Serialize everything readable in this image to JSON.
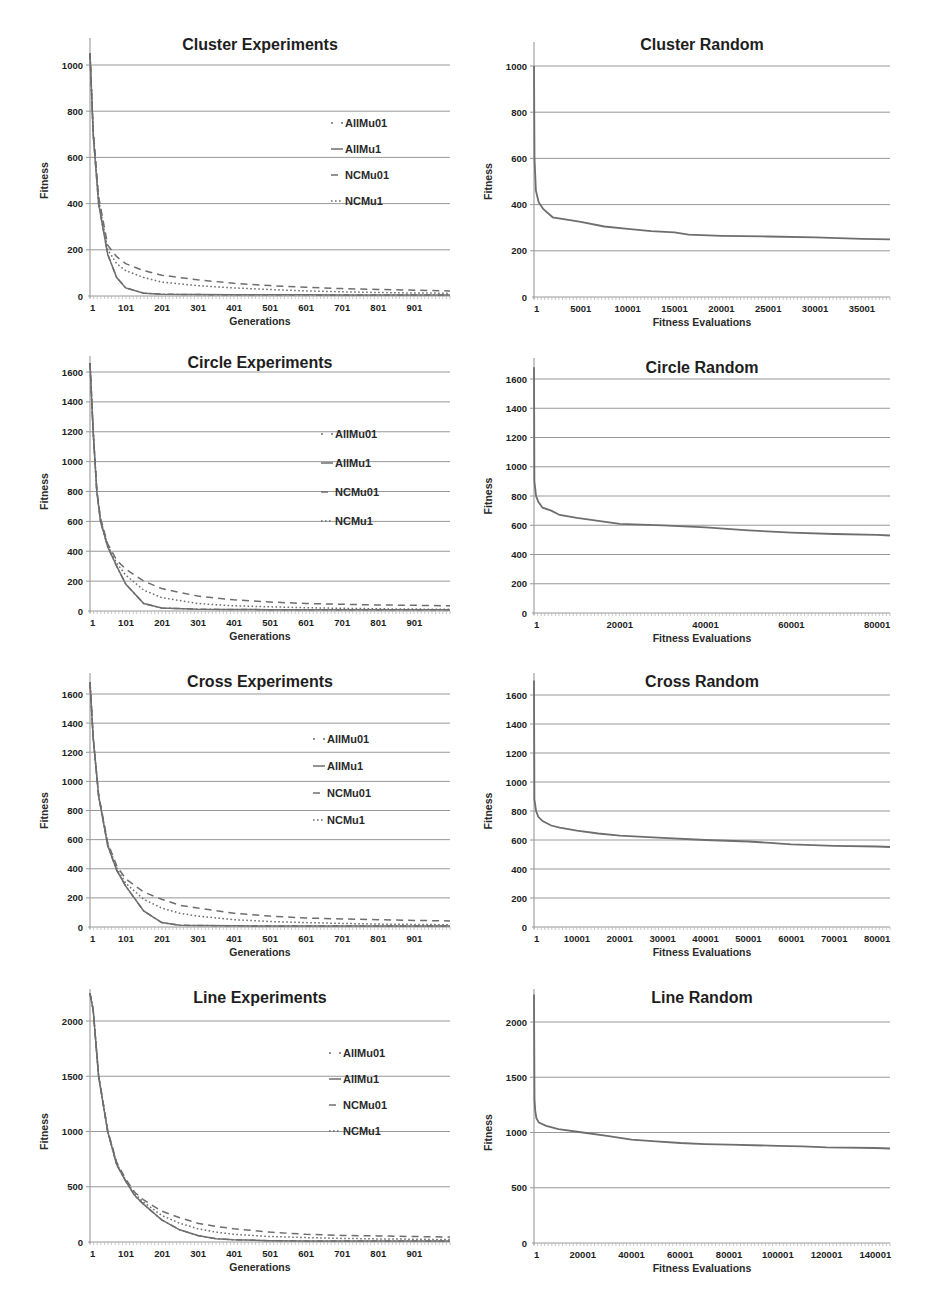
{
  "page": {
    "width": 931,
    "height": 1316
  },
  "colors": {
    "grid": "#8c8c8c",
    "axis": "#9a9a9a",
    "series": "#6e6e6e",
    "text": "#1e1e1e"
  },
  "chart_data": [
    {
      "id": "cluster-experiments",
      "type": "line",
      "title": "Cluster Experiments",
      "xlabel": "Generations",
      "ylabel": "Fitness",
      "xticks": [
        "1",
        "101",
        "201",
        "301",
        "401",
        "501",
        "601",
        "701",
        "801",
        "901"
      ],
      "yticks": [
        0,
        200,
        400,
        600,
        800,
        1000
      ],
      "ylim": [
        0,
        1060
      ],
      "xlim": [
        1,
        1000
      ],
      "grid": true,
      "legend_position": "right-inside",
      "x": [
        1,
        10,
        25,
        50,
        75,
        100,
        150,
        200,
        300,
        400,
        500,
        600,
        700,
        800,
        900,
        1000
      ],
      "series": [
        {
          "name": "AllMu01",
          "style": "dash-dot",
          "values": [
            1050,
            700,
            400,
            180,
            80,
            35,
            12,
            8,
            6,
            5,
            5,
            5,
            4,
            4,
            4,
            4
          ]
        },
        {
          "name": "AllMu1",
          "style": "solid",
          "values": [
            1050,
            700,
            400,
            180,
            80,
            35,
            12,
            8,
            6,
            5,
            5,
            5,
            4,
            4,
            4,
            4
          ]
        },
        {
          "name": "NCMu01",
          "style": "dashed",
          "values": [
            1050,
            720,
            430,
            220,
            170,
            140,
            110,
            90,
            70,
            55,
            45,
            38,
            32,
            28,
            25,
            22
          ]
        },
        {
          "name": "NCMu1",
          "style": "dotted",
          "values": [
            1050,
            710,
            420,
            200,
            140,
            110,
            80,
            60,
            45,
            35,
            28,
            22,
            18,
            15,
            13,
            12
          ]
        }
      ]
    },
    {
      "id": "cluster-random",
      "type": "line",
      "title": "Cluster Random",
      "xlabel": "Fitness Evaluations",
      "ylabel": "Fitness",
      "xticks": [
        "1",
        "5001",
        "10001",
        "15001",
        "20001",
        "25001",
        "30001",
        "35001"
      ],
      "yticks": [
        0,
        200,
        400,
        600,
        800,
        1000
      ],
      "ylim": [
        0,
        1000
      ],
      "xlim": [
        1,
        38000
      ],
      "grid": true,
      "x": [
        1,
        50,
        200,
        500,
        1000,
        2000,
        5000,
        7500,
        10000,
        12500,
        15000,
        16500,
        20000,
        25000,
        30000,
        35000,
        38000
      ],
      "series": [
        {
          "name": "Random",
          "style": "solid",
          "values": [
            1000,
            600,
            460,
            410,
            380,
            345,
            325,
            305,
            295,
            285,
            280,
            270,
            265,
            262,
            258,
            252,
            250
          ]
        }
      ]
    },
    {
      "id": "circle-experiments",
      "type": "line",
      "title": "Circle Experiments",
      "xlabel": "Generations",
      "ylabel": "Fitness",
      "xticks": [
        "1",
        "101",
        "201",
        "301",
        "401",
        "501",
        "601",
        "701",
        "801",
        "901"
      ],
      "yticks": [
        0,
        200,
        400,
        600,
        800,
        1000,
        1200,
        1400,
        1600
      ],
      "ylim": [
        0,
        1680
      ],
      "xlim": [
        1,
        1000
      ],
      "grid": true,
      "legend_position": "right-inside",
      "x": [
        1,
        10,
        20,
        30,
        50,
        75,
        100,
        150,
        200,
        300,
        400,
        500,
        600,
        700,
        800,
        900,
        1000
      ],
      "series": [
        {
          "name": "AllMu01",
          "style": "dash-dot",
          "values": [
            1660,
            1200,
            800,
            600,
            430,
            300,
            180,
            50,
            20,
            12,
            10,
            9,
            8,
            8,
            8,
            8,
            8
          ]
        },
        {
          "name": "AllMu1",
          "style": "solid",
          "values": [
            1660,
            1200,
            800,
            600,
            430,
            300,
            180,
            50,
            20,
            12,
            10,
            9,
            8,
            8,
            8,
            8,
            8
          ]
        },
        {
          "name": "NCMu01",
          "style": "dashed",
          "values": [
            1660,
            1200,
            810,
            620,
            450,
            340,
            280,
            200,
            150,
            100,
            75,
            60,
            50,
            45,
            40,
            38,
            35
          ]
        },
        {
          "name": "NCMu1",
          "style": "dotted",
          "values": [
            1660,
            1200,
            805,
            610,
            440,
            320,
            240,
            140,
            90,
            50,
            35,
            28,
            22,
            18,
            15,
            13,
            12
          ]
        }
      ]
    },
    {
      "id": "circle-random",
      "type": "line",
      "title": "Circle Random",
      "xlabel": "Fitness Evaluations",
      "ylabel": "Fitness",
      "xticks": [
        "1",
        "20001",
        "40001",
        "60001",
        "80001"
      ],
      "yticks": [
        0,
        200,
        400,
        600,
        800,
        1000,
        1200,
        1400,
        1600
      ],
      "ylim": [
        0,
        1680
      ],
      "xlim": [
        1,
        83000
      ],
      "grid": true,
      "x": [
        1,
        100,
        500,
        1000,
        2000,
        4000,
        6000,
        10000,
        15000,
        20000,
        30000,
        40000,
        50000,
        60000,
        70000,
        80000,
        83000
      ],
      "series": [
        {
          "name": "Random",
          "style": "solid",
          "values": [
            1680,
            900,
            800,
            760,
            720,
            700,
            670,
            650,
            630,
            610,
            600,
            585,
            565,
            550,
            540,
            535,
            530
          ]
        }
      ]
    },
    {
      "id": "cross-experiments",
      "type": "line",
      "title": "Cross Experiments",
      "xlabel": "Generations",
      "ylabel": "Fitness",
      "xticks": [
        "1",
        "101",
        "201",
        "301",
        "401",
        "501",
        "601",
        "701",
        "801",
        "901"
      ],
      "yticks": [
        0,
        200,
        400,
        600,
        800,
        1000,
        1200,
        1400,
        1600
      ],
      "ylim": [
        0,
        1700
      ],
      "xlim": [
        1,
        1000
      ],
      "grid": true,
      "legend_position": "right-inside",
      "x": [
        1,
        10,
        25,
        50,
        75,
        100,
        150,
        200,
        250,
        300,
        400,
        500,
        600,
        700,
        800,
        900,
        1000
      ],
      "series": [
        {
          "name": "AllMu01",
          "style": "dash-dot",
          "values": [
            1680,
            1300,
            900,
            560,
            390,
            280,
            110,
            30,
            12,
            10,
            8,
            7,
            7,
            6,
            6,
            6,
            6
          ]
        },
        {
          "name": "AllMu1",
          "style": "solid",
          "values": [
            1680,
            1300,
            900,
            560,
            390,
            280,
            110,
            30,
            12,
            10,
            8,
            7,
            7,
            6,
            6,
            6,
            6
          ]
        },
        {
          "name": "NCMu01",
          "style": "dashed",
          "values": [
            1680,
            1300,
            910,
            580,
            420,
            330,
            240,
            190,
            150,
            130,
            95,
            75,
            62,
            55,
            50,
            45,
            42
          ]
        },
        {
          "name": "NCMu1",
          "style": "dotted",
          "values": [
            1680,
            1300,
            905,
            570,
            405,
            300,
            190,
            130,
            95,
            75,
            50,
            38,
            30,
            25,
            20,
            18,
            15
          ]
        }
      ]
    },
    {
      "id": "cross-random",
      "type": "line",
      "title": "Cross Random",
      "xlabel": "Fitness Evaluations",
      "ylabel": "Fitness",
      "xticks": [
        "1",
        "10001",
        "20001",
        "30001",
        "40001",
        "50001",
        "60001",
        "70001",
        "80001"
      ],
      "yticks": [
        0,
        200,
        400,
        600,
        800,
        1000,
        1200,
        1400,
        1600
      ],
      "ylim": [
        0,
        1700
      ],
      "xlim": [
        1,
        83000
      ],
      "grid": true,
      "x": [
        1,
        100,
        500,
        1000,
        2000,
        4000,
        6000,
        10000,
        15000,
        20000,
        30000,
        40000,
        50000,
        55000,
        60000,
        65000,
        70000,
        80000,
        83000
      ],
      "series": [
        {
          "name": "Random",
          "style": "solid",
          "values": [
            1700,
            880,
            800,
            760,
            730,
            700,
            685,
            665,
            645,
            630,
            615,
            600,
            590,
            580,
            570,
            565,
            560,
            555,
            552
          ]
        }
      ]
    },
    {
      "id": "line-experiments",
      "type": "line",
      "title": "Line Experiments",
      "xlabel": "Generations",
      "ylabel": "Fitness",
      "xticks": [
        "1",
        "101",
        "201",
        "301",
        "401",
        "501",
        "601",
        "701",
        "801",
        "901"
      ],
      "yticks": [
        0,
        500,
        1000,
        1500,
        2000
      ],
      "ylim": [
        0,
        2300
      ],
      "xlim": [
        1,
        1000
      ],
      "grid": true,
      "legend_position": "right-inside",
      "x": [
        1,
        10,
        25,
        50,
        75,
        100,
        125,
        150,
        200,
        250,
        300,
        350,
        400,
        500,
        600,
        700,
        800,
        900,
        1000
      ],
      "series": [
        {
          "name": "AllMu01",
          "style": "dash-dot",
          "values": [
            2250,
            2100,
            1500,
            1000,
            700,
            550,
            420,
            340,
            200,
            110,
            60,
            30,
            20,
            12,
            10,
            9,
            8,
            8,
            8
          ]
        },
        {
          "name": "AllMu1",
          "style": "solid",
          "values": [
            2250,
            2100,
            1500,
            1000,
            700,
            550,
            420,
            340,
            200,
            110,
            60,
            30,
            20,
            12,
            10,
            9,
            8,
            8,
            8
          ]
        },
        {
          "name": "NCMu01",
          "style": "dashed",
          "values": [
            2250,
            2100,
            1510,
            1010,
            720,
            570,
            450,
            380,
            280,
            220,
            170,
            140,
            120,
            90,
            70,
            60,
            55,
            50,
            45
          ]
        },
        {
          "name": "NCMu1",
          "style": "dotted",
          "values": [
            2250,
            2100,
            1505,
            1005,
            710,
            560,
            435,
            360,
            240,
            170,
            120,
            90,
            70,
            50,
            40,
            33,
            28,
            25,
            22
          ]
        }
      ]
    },
    {
      "id": "line-random",
      "type": "line",
      "title": "Line Random",
      "xlabel": "Fitness Evaluations",
      "ylabel": "Fitness",
      "xticks": [
        "1",
        "20001",
        "40001",
        "60001",
        "80001",
        "100001",
        "120001",
        "140001"
      ],
      "yticks": [
        0,
        500,
        1000,
        1500,
        2000
      ],
      "ylim": [
        0,
        2300
      ],
      "xlim": [
        1,
        146000
      ],
      "grid": true,
      "x": [
        1,
        200,
        500,
        1000,
        2000,
        5000,
        10000,
        20000,
        30000,
        40000,
        50000,
        60000,
        70000,
        80000,
        100000,
        110000,
        120000,
        140000,
        146000
      ],
      "series": [
        {
          "name": "Random",
          "style": "solid",
          "values": [
            2250,
            1300,
            1200,
            1130,
            1090,
            1060,
            1030,
            1000,
            970,
            935,
            920,
            905,
            895,
            890,
            880,
            875,
            865,
            860,
            855
          ]
        }
      ]
    }
  ]
}
